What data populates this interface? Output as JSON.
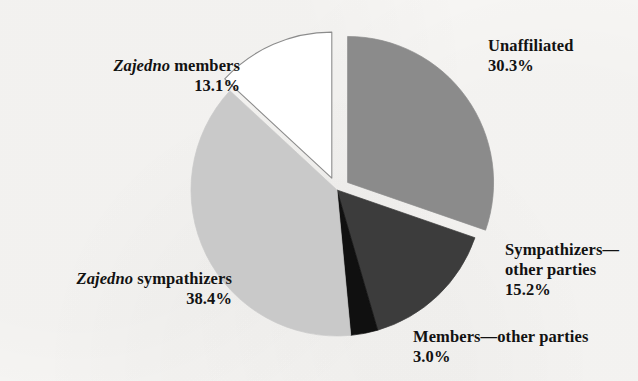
{
  "chart_data": {
    "type": "pie",
    "title": "",
    "subtitle": "",
    "xlabel": "",
    "ylabel": "",
    "grid": false,
    "legend_position": "none",
    "units": "percent",
    "total": 100.0,
    "start_angle_deg": 0,
    "direction": "clockwise",
    "categories": [
      "Unaffiliated",
      "Sympathizers—other parties",
      "Members—other parties",
      "Zajedno sympathizers",
      "Zajedno members"
    ],
    "values": [
      30.3,
      15.2,
      3.0,
      38.4,
      13.1
    ],
    "slices": [
      {
        "name": "Unaffiliated",
        "value": 30.3,
        "value_text": "30.3%",
        "color": "#8b8b8b",
        "stroke": "#8b8b8b",
        "exploded": true
      },
      {
        "name": "Sympathizers—other parties",
        "value": 15.2,
        "value_text": "15.2%",
        "color": "#3c3c3c",
        "stroke": "#3c3c3c",
        "exploded": false
      },
      {
        "name": "Members—other parties",
        "value": 3.0,
        "value_text": "3.0%",
        "color": "#101010",
        "stroke": "#101010",
        "exploded": false
      },
      {
        "name": "Zajedno sympathizers",
        "value": 38.4,
        "value_text": "38.4%",
        "color": "#c9c9c9",
        "stroke": "#c9c9c9",
        "exploded": false
      },
      {
        "name": "Zajedno members",
        "value": 13.1,
        "value_text": "13.1%",
        "color": "#ffffff",
        "stroke": "#8c8c8c",
        "exploded": true
      }
    ]
  },
  "labels": {
    "zajedno_members": {
      "emphasis": "Zajedno",
      "rest": " members",
      "value": "13.1%"
    },
    "zajedno_sympathizers": {
      "emphasis": "Zajedno",
      "rest": " sympathizers",
      "value": "38.4%"
    },
    "unaffiliated": {
      "name": "Unaffiliated",
      "value": "30.3%"
    },
    "sympathizers_other": {
      "line1": "Sympathizers—",
      "line2": "other parties",
      "value": "15.2%"
    },
    "members_other": {
      "line1": "Members—other parties",
      "value": "3.0%"
    }
  },
  "colors": {
    "background": "#f8f7f5",
    "text": "#121212",
    "slice_unaffiliated": "#8b8b8b",
    "slice_sympathizers_other": "#3c3c3c",
    "slice_members_other": "#101010",
    "slice_zajedno_sympathizers": "#c9c9c9",
    "slice_zajedno_members": "#ffffff"
  }
}
